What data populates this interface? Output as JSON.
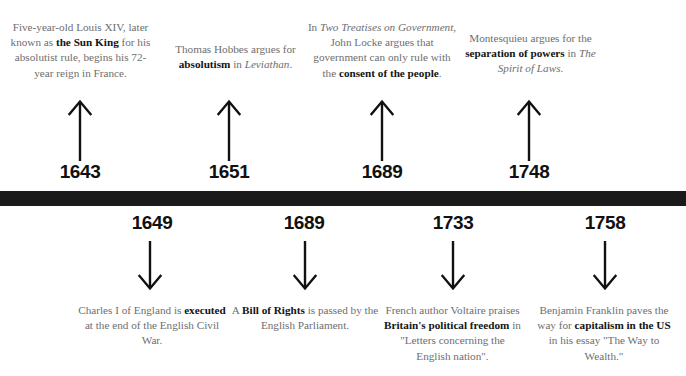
{
  "timeline": {
    "bar_color": "#1a1a1a",
    "body_text_color": "#6e6e6e",
    "emphasis_text_color": "#141414",
    "year_color": "#111111",
    "above": [
      {
        "year": "1643",
        "arrow": "arrow-up-icon",
        "text_plain": "Five-year-old Louis XIV, later known as the Sun King for his absolutist rule, begins his 72-year reign in France.",
        "segments": [
          {
            "t": "Five-year-old Louis XIV, later known as ",
            "style": "normal"
          },
          {
            "t": "the Sun King",
            "style": "bold"
          },
          {
            "t": " for his absolutist rule, begins his 72-year reign in France.",
            "style": "normal"
          }
        ]
      },
      {
        "year": "1651",
        "arrow": "arrow-up-icon",
        "text_plain": "Thomas Hobbes argues for absolutism in Leviathan.",
        "segments": [
          {
            "t": "Thomas Hobbes argues for ",
            "style": "normal"
          },
          {
            "t": "absolutism",
            "style": "bold"
          },
          {
            "t": " in ",
            "style": "normal"
          },
          {
            "t": "Leviathan",
            "style": "italic"
          },
          {
            "t": ".",
            "style": "normal"
          }
        ]
      },
      {
        "year": "1689",
        "arrow": "arrow-up-icon",
        "text_plain": "In Two Treatises on Government, John Locke argues that government can only rule with the consent of the people.",
        "segments": [
          {
            "t": "In ",
            "style": "normal"
          },
          {
            "t": "Two Treatises on Government",
            "style": "italic"
          },
          {
            "t": ", John Locke argues that government can only rule with the ",
            "style": "normal"
          },
          {
            "t": "consent of the people",
            "style": "bold"
          },
          {
            "t": ".",
            "style": "normal"
          }
        ]
      },
      {
        "year": "1748",
        "arrow": "arrow-up-icon",
        "text_plain": "Montesquieu argues for the separation of powers in The Spirit of Laws.",
        "segments": [
          {
            "t": "Montesquieu argues for the ",
            "style": "normal"
          },
          {
            "t": "separation of powers",
            "style": "bold"
          },
          {
            "t": " in ",
            "style": "normal"
          },
          {
            "t": "The Spirit of Laws",
            "style": "italic"
          },
          {
            "t": ".",
            "style": "normal"
          }
        ]
      }
    ],
    "below": [
      {
        "year": "1649",
        "arrow": "arrow-down-icon",
        "text_plain": "Charles I of England is executed at the end of the English Civil War.",
        "segments": [
          {
            "t": "Charles I of England is ",
            "style": "normal"
          },
          {
            "t": "executed",
            "style": "bold"
          },
          {
            "t": " at the end of the English Civil War.",
            "style": "normal"
          }
        ]
      },
      {
        "year": "1689",
        "arrow": "arrow-down-icon",
        "text_plain": "A Bill of Rights is passed by the English Parliament.",
        "segments": [
          {
            "t": "A ",
            "style": "normal"
          },
          {
            "t": "Bill of Rights",
            "style": "bold"
          },
          {
            "t": " is passed by the English Parliament.",
            "style": "normal"
          }
        ]
      },
      {
        "year": "1733",
        "arrow": "arrow-down-icon",
        "text_plain": "French author Voltaire praises Britain's political freedom in \"Letters concerning the English nation\".",
        "segments": [
          {
            "t": "French author Voltaire praises ",
            "style": "normal"
          },
          {
            "t": "Britain's political freedom",
            "style": "bold"
          },
          {
            "t": " in \"Letters concerning the English nation\".",
            "style": "normal"
          }
        ]
      },
      {
        "year": "1758",
        "arrow": "arrow-down-icon",
        "text_plain": "Benjamin Franklin paves the way for capitalism in the US in his essay \"The Way to Wealth.\"",
        "segments": [
          {
            "t": "Benjamin Franklin paves the way for ",
            "style": "normal"
          },
          {
            "t": "capitalism in the US",
            "style": "bold"
          },
          {
            "t": " in his essay \"The Way to Wealth.\"",
            "style": "normal"
          }
        ]
      }
    ]
  }
}
